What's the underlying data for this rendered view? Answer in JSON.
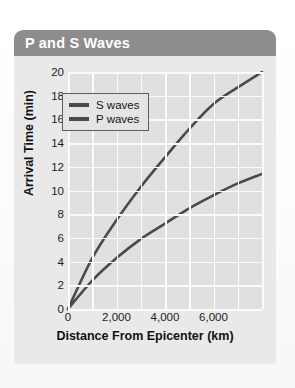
{
  "card": {
    "title": "P and S Waves"
  },
  "chart_data": {
    "type": "line",
    "title": "P and S Waves",
    "xlabel": "Distance From Epicenter (km)",
    "ylabel": "Arrival Time (min)",
    "xlim": [
      0,
      8000
    ],
    "ylim": [
      0,
      20
    ],
    "grid": true,
    "legend_position": "top-left",
    "x_tick_labels": [
      "0",
      "2,000",
      "4,000",
      "6,000"
    ],
    "x_tick_values": [
      0,
      2000,
      4000,
      6000
    ],
    "y_tick_labels": [
      "0",
      "2",
      "4",
      "6",
      "8",
      "10",
      "12",
      "14",
      "16",
      "18",
      "20"
    ],
    "y_tick_values": [
      0,
      2,
      4,
      6,
      8,
      10,
      12,
      14,
      16,
      18,
      20
    ],
    "x_gridline_values": [
      0,
      1000,
      2000,
      3000,
      4000,
      5000,
      6000,
      7000,
      8000
    ],
    "x": [
      0,
      1000,
      2000,
      3000,
      4000,
      5000,
      6000,
      7000,
      8000
    ],
    "series": [
      {
        "name": "S waves",
        "color": "#4a4a4a",
        "values": [
          0,
          4.3,
          7.5,
          10.3,
          12.8,
          15.2,
          17.3,
          18.7,
          20.0
        ]
      },
      {
        "name": "P waves",
        "color": "#4a4a4a",
        "values": [
          0,
          2.4,
          4.3,
          5.9,
          7.2,
          8.5,
          9.6,
          10.6,
          11.4
        ]
      }
    ]
  },
  "colors": {
    "title_bar": "#8d8d8d",
    "card_body": "#e9e9e9",
    "plot_area": "#e0e0e0",
    "gridline": "#fbfbfb",
    "curve": "#4a4a4a"
  }
}
